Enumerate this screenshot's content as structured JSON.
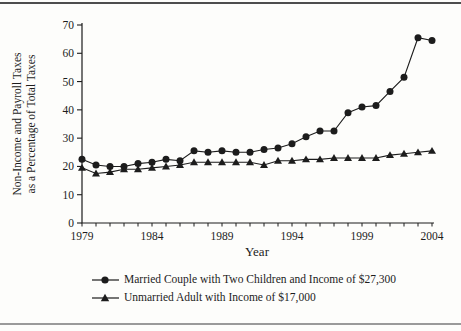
{
  "figure": {
    "ink_color": "#1c1c1c",
    "background_color": "#fdfdfb",
    "top_rule_color": "#4d4d4d",
    "bottom_rule_color": "#9a9a9a"
  },
  "chart_data": {
    "type": "line",
    "title": "",
    "xlabel": "Year",
    "ylabel": "Non-Income and Payroll Taxes as a Percentage of Total Taxes",
    "ylabel_lines": [
      "Non-Income and Payroll Taxes",
      "as a Percentage of Total Taxes"
    ],
    "xlim": [
      1979,
      2004
    ],
    "ylim": [
      0,
      70
    ],
    "x_tick_labels": [
      "1979",
      "1984",
      "1989",
      "1994",
      "1999",
      "2004"
    ],
    "x_minor_tick_every": 1,
    "y_ticks": [
      0,
      10,
      20,
      30,
      40,
      50,
      60,
      70
    ],
    "grid": false,
    "legend_position": "below",
    "x": [
      1979,
      1980,
      1981,
      1982,
      1983,
      1984,
      1985,
      1986,
      1987,
      1988,
      1989,
      1990,
      1991,
      1992,
      1993,
      1994,
      1995,
      1996,
      1997,
      1998,
      1999,
      2000,
      2001,
      2002,
      2003,
      2004
    ],
    "series": [
      {
        "name": "Married Couple with Two Children and Income of $27,300",
        "marker": "circle",
        "values": [
          22.5,
          20.5,
          20,
          20,
          21,
          21.5,
          22.5,
          22,
          25.5,
          25,
          25.5,
          25,
          25,
          26,
          26.5,
          28,
          30.5,
          32.5,
          32.5,
          39,
          41,
          41.5,
          46.5,
          51.5,
          65.5,
          64.5
        ]
      },
      {
        "name": "Unmarried Adult with Income of $17,000",
        "marker": "triangle",
        "values": [
          19.5,
          17.5,
          18,
          19,
          19,
          19.5,
          20,
          20.5,
          21.5,
          21.5,
          21.5,
          21.5,
          21.5,
          20.5,
          22,
          22,
          22.5,
          22.5,
          23,
          23,
          23,
          23,
          24,
          24.5,
          25,
          25.5
        ]
      }
    ]
  }
}
